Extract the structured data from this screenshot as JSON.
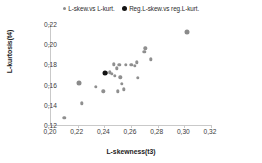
{
  "chart_data": {
    "type": "scatter",
    "title": "",
    "xlabel": "L-skewness(t3)",
    "ylabel": "L-kurtosis(t4)",
    "xlim": [
      0.2,
      0.32
    ],
    "ylim": [
      0.12,
      0.22
    ],
    "xticks": [
      "0,20",
      "0,22",
      "0,24",
      "0,26",
      "0,28",
      "0,30",
      "0,32"
    ],
    "yticks": [
      "0,12",
      "0,14",
      "0,16",
      "0,18",
      "0,20",
      "0,22"
    ],
    "xtick_values": [
      0.2,
      0.22,
      0.24,
      0.26,
      0.28,
      0.3,
      0.32
    ],
    "ytick_values": [
      0.12,
      0.14,
      0.16,
      0.18,
      0.2,
      0.22
    ],
    "grid": false,
    "legend_position": "top-center",
    "series": [
      {
        "name": "L-skew.vs L-kurt.",
        "marker": "circle-small",
        "color": "#8f8f8f",
        "points": [
          {
            "x": 0.21,
            "y": 0.1272,
            "size": "small"
          },
          {
            "x": 0.2208,
            "y": 0.1615,
            "size": "large"
          },
          {
            "x": 0.2232,
            "y": 0.1415,
            "size": "small"
          },
          {
            "x": 0.2338,
            "y": 0.158,
            "size": "small"
          },
          {
            "x": 0.2392,
            "y": 0.1532,
            "size": "small"
          },
          {
            "x": 0.2418,
            "y": 0.1715,
            "size": "small"
          },
          {
            "x": 0.244,
            "y": 0.1722,
            "size": "small"
          },
          {
            "x": 0.2455,
            "y": 0.1706,
            "size": "small"
          },
          {
            "x": 0.247,
            "y": 0.18,
            "size": "small"
          },
          {
            "x": 0.248,
            "y": 0.169,
            "size": "small"
          },
          {
            "x": 0.2492,
            "y": 0.1762,
            "size": "small"
          },
          {
            "x": 0.25,
            "y": 0.1532,
            "size": "small"
          },
          {
            "x": 0.2512,
            "y": 0.1798,
            "size": "small"
          },
          {
            "x": 0.252,
            "y": 0.1672,
            "size": "small"
          },
          {
            "x": 0.2532,
            "y": 0.161,
            "size": "small"
          },
          {
            "x": 0.2545,
            "y": 0.1552,
            "size": "small"
          },
          {
            "x": 0.256,
            "y": 0.1798,
            "size": "small"
          },
          {
            "x": 0.2602,
            "y": 0.1795,
            "size": "small"
          },
          {
            "x": 0.2628,
            "y": 0.1785,
            "size": "small"
          },
          {
            "x": 0.2645,
            "y": 0.1822,
            "size": "small"
          },
          {
            "x": 0.2652,
            "y": 0.1668,
            "size": "small"
          },
          {
            "x": 0.27,
            "y": 0.1922,
            "size": "small"
          },
          {
            "x": 0.2708,
            "y": 0.196,
            "size": "small"
          },
          {
            "x": 0.2748,
            "y": 0.1852,
            "size": "small"
          },
          {
            "x": 0.3022,
            "y": 0.2125,
            "size": "large"
          }
        ]
      },
      {
        "name": "Reg.L-skew.vs reg.L-kurt.",
        "marker": "circle-large",
        "color": "#131313",
        "points": [
          {
            "x": 0.2405,
            "y": 0.171,
            "size": "large"
          }
        ]
      }
    ]
  },
  "legend": {
    "entries": [
      {
        "label": "L-skew.vs L-kurt."
      },
      {
        "label": "Reg.L-skew.vs reg.L-kurt."
      }
    ]
  }
}
